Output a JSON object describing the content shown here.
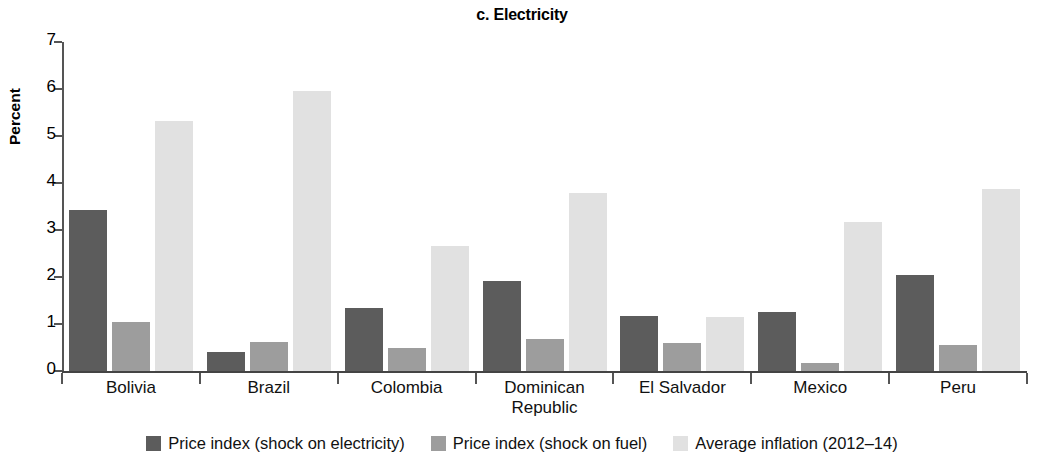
{
  "chart_data": {
    "type": "bar",
    "title": "c. Electricity",
    "xlabel": "",
    "ylabel": "Percent",
    "ylim": [
      0,
      7
    ],
    "ytick_labels": [
      "0",
      "1",
      "2",
      "3",
      "4",
      "5",
      "6",
      "7"
    ],
    "grid": false,
    "legend_position": "bottom",
    "categories": [
      "Bolivia",
      "Brazil",
      "Colombia",
      "Dominican\nRepublic",
      "El Salvador",
      "Mexico",
      "Peru"
    ],
    "series": [
      {
        "name": "Price index (shock on electricity)",
        "color": "#5c5c5c",
        "values": [
          3.42,
          0.4,
          1.35,
          1.92,
          1.18,
          1.26,
          2.04
        ]
      },
      {
        "name": "Price index (shock on fuel)",
        "color": "#9d9d9d",
        "values": [
          1.05,
          0.61,
          0.5,
          0.69,
          0.59,
          0.17,
          0.55
        ]
      },
      {
        "name": "Average inflation (2012–14)",
        "color": "#e1e1e1",
        "values": [
          5.32,
          5.96,
          2.66,
          3.79,
          1.14,
          3.16,
          3.88
        ]
      }
    ]
  },
  "category_lines": [
    [
      "Bolivia"
    ],
    [
      "Brazil"
    ],
    [
      "Colombia"
    ],
    [
      "Dominican",
      "Republic"
    ],
    [
      "El Salvador"
    ],
    [
      "Mexico"
    ],
    [
      "Peru"
    ]
  ]
}
